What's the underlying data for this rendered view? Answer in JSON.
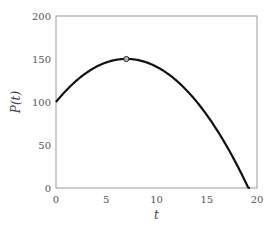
{
  "chart_data": {
    "type": "line",
    "title": "",
    "xlabel": "t",
    "ylabel": "P(t)",
    "xlim": [
      0,
      20
    ],
    "ylim": [
      0,
      200
    ],
    "xticks": [
      0,
      5,
      10,
      15,
      20
    ],
    "yticks": [
      0,
      50,
      100,
      150,
      200
    ],
    "xtick_labels": [
      "0",
      "5",
      "10",
      "15",
      "20"
    ],
    "ytick_labels": [
      "0",
      "50",
      "100",
      "150",
      "200"
    ],
    "grid": false,
    "legend": null,
    "series": [
      {
        "name": "P(t)",
        "color": "#111111",
        "x": [
          0,
          1,
          2,
          3,
          4,
          5,
          6,
          7,
          8,
          9,
          10,
          11,
          12,
          13,
          14,
          15,
          16,
          17,
          18,
          19,
          19.3
        ],
        "y": [
          100,
          113,
          124,
          133,
          141,
          146,
          149,
          150,
          149,
          146,
          142,
          134,
          125,
          114,
          102,
          87,
          71,
          52,
          32,
          8,
          0
        ]
      }
    ],
    "markers": [
      {
        "name": "maximum",
        "x": 7,
        "y": 150,
        "shape": "open-circle"
      }
    ]
  }
}
